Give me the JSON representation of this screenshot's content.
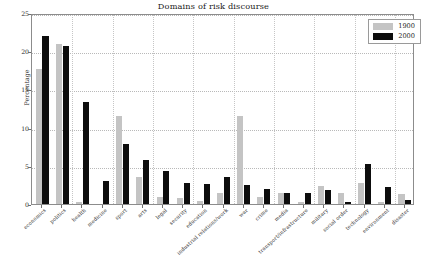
{
  "chart_data": {
    "type": "bar",
    "title": "Domains of risk discourse",
    "xlabel": "",
    "ylabel": "Percentage",
    "ylim": [
      0,
      25
    ],
    "yticks": [
      0,
      5,
      10,
      15,
      20,
      25
    ],
    "grid": true,
    "legend_position": "upper right",
    "categories": [
      "economics",
      "politics",
      "health",
      "medicine",
      "sport",
      "arts",
      "legal",
      "security",
      "education",
      "industrial relations/work",
      "war",
      "crime",
      "media",
      "transport/infrastructure",
      "military",
      "social order",
      "technology",
      "environment",
      "disaster"
    ],
    "series": [
      {
        "name": "1900",
        "color": "#c4c4c4",
        "values": [
          17.7,
          21.0,
          0.2,
          0.0,
          11.5,
          3.5,
          0.9,
          0.8,
          0.4,
          1.5,
          11.5,
          0.9,
          1.5,
          0.3,
          2.4,
          1.4,
          2.8,
          0.2,
          1.3
        ]
      },
      {
        "name": "2000",
        "color": "#0d0d0d",
        "values": [
          22.0,
          20.7,
          13.3,
          3.0,
          7.9,
          5.8,
          4.3,
          2.7,
          2.6,
          3.6,
          2.5,
          2.0,
          1.5,
          1.4,
          1.8,
          0.3,
          5.2,
          2.2,
          0.5
        ]
      }
    ]
  },
  "legend": {
    "items": [
      {
        "label": "1900",
        "swatch": "#c4c4c4"
      },
      {
        "label": "2000",
        "swatch": "#0d0d0d"
      }
    ]
  },
  "axes": {
    "y_label": "Percentage",
    "y_tick_labels": [
      "0",
      "5",
      "10",
      "15",
      "20",
      "25"
    ]
  }
}
